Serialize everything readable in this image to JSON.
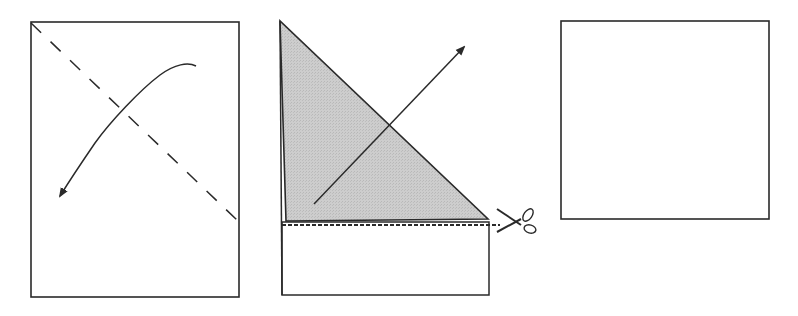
{
  "diagram": {
    "type": "paper-folding-instructions",
    "colors": {
      "stroke": "#2a2a2a",
      "fold_shade": "#c8c8c8",
      "background": "#ffffff"
    },
    "steps": [
      {
        "id": 1,
        "description": "Rectangular sheet with diagonal dashed fold line from top-left corner; curved arrow shows folding top-right corner down to the left",
        "elements": [
          "rectangle-sheet",
          "dashed-fold-line",
          "curved-fold-arrow"
        ]
      },
      {
        "id": 2,
        "description": "Sheet folded into a shaded triangle over the top; dotted cut line along triangle base with scissors; arrow shows unfolding",
        "elements": [
          "shaded-folded-triangle",
          "remaining-strip",
          "dotted-cut-line",
          "scissors-icon",
          "unfold-arrow"
        ]
      },
      {
        "id": 3,
        "description": "Resulting square sheet",
        "elements": [
          "square-sheet"
        ]
      }
    ]
  }
}
